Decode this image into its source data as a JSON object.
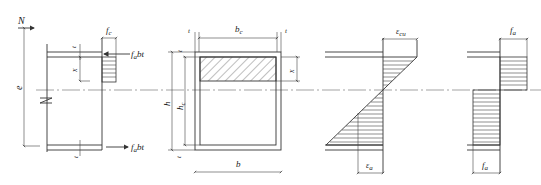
{
  "figure": {
    "type": "structural-section-diagram",
    "panels": [
      {
        "id": "elevation",
        "labels": {
          "axial_force": "N",
          "eccentricity": "e",
          "flange_thickness_top": "t",
          "flange_thickness_bottom": "t",
          "compression_depth": "x",
          "concrete_stress": "f",
          "concrete_stress_sub": "c",
          "steel_force_top": "f",
          "steel_force_top_sub": "a",
          "steel_force_top_suffix": "bt",
          "steel_force_bottom": "f",
          "steel_force_bottom_sub": "a",
          "steel_force_bottom_suffix": "bt"
        }
      },
      {
        "id": "cross-section",
        "labels": {
          "core_width": "b",
          "core_width_sub": "c",
          "wall_thickness_left": "t",
          "wall_thickness_right": "t",
          "total_height": "h",
          "core_height": "h",
          "core_height_sub": "c",
          "wall_thickness_top": "t",
          "wall_thickness_bottom": "t",
          "compression_depth": "x",
          "total_width": "b"
        }
      },
      {
        "id": "strain-distribution",
        "labels": {
          "ultimate_strain": "ε",
          "ultimate_strain_sub": "cu",
          "steel_strain": "ε",
          "steel_strain_sub": "a"
        }
      },
      {
        "id": "steel-stress-distribution",
        "labels": {
          "tension_stress": "f",
          "tension_stress_sub": "a",
          "compression_stress": "f",
          "compression_stress_sub": "a"
        }
      }
    ],
    "colors": {
      "line": "#333333",
      "hatch": "#444444",
      "background": "#ffffff"
    }
  }
}
